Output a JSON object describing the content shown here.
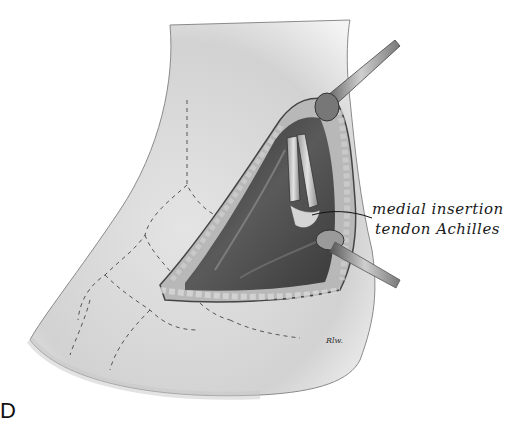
{
  "figure": {
    "panel_letter": "D",
    "annotation": {
      "line1": "medial insertion",
      "line2": "tendon Achilles"
    },
    "signature": "Rlw."
  },
  "colors": {
    "background": "#ffffff",
    "skin": "#e6e6e6",
    "skin_shadow": "#bdbdbd",
    "wound_dark": "#3a3a3a",
    "wound_mid": "#6f6f6f",
    "tissue_light": "#c9c9c9",
    "ink": "#1a1a1a"
  }
}
